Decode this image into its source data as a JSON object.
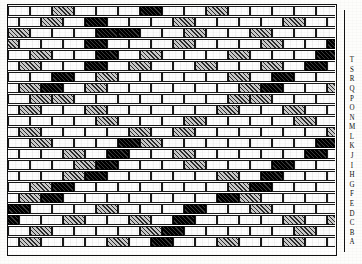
{
  "plate": {
    "title": "Decorative diaper brickwork elevation",
    "description": "Measured elevation of a brick wall laid in stretcher bond with grey and dark vitrified headers forming repeating lozenge (diamond) diaper patterns.",
    "drawing_type": "brick-bond-elevation"
  },
  "legend": {
    "brick_kinds": [
      {
        "key": "plain",
        "label": "plain red brick",
        "color": "#fdfdfd"
      },
      {
        "key": "grey",
        "label": "grey diapered brick",
        "color": "#9a9a9a"
      },
      {
        "key": "mid",
        "label": "mid-tone brick",
        "color": "#8d8d8d"
      },
      {
        "key": "dark",
        "label": "dark vitrified header",
        "color": "#121212"
      }
    ]
  },
  "course_labels": {
    "orientation": "vertical",
    "reading": "bottom-to-top",
    "items": [
      "A",
      "B",
      "C",
      "D",
      "E",
      "F",
      "G",
      "H",
      "I",
      "J",
      "K",
      "L",
      "M",
      "N",
      "O",
      "P",
      "Q",
      "R",
      "S",
      "T"
    ]
  },
  "geometry": {
    "rows": 22,
    "row_height": 11,
    "brick_width": 22,
    "offset": 11,
    "wall_width": 327,
    "wall_height": 248
  },
  "bond": {
    "name": "stretcher bond",
    "rows": [
      {
        "offset": 0,
        "pattern": "p p p g p p p d p p g p p p p p g p p p d p p p g p"
      },
      {
        "offset": 11,
        "pattern": "p p g p d p p p g p p p p g p p p d p p g p p p p"
      },
      {
        "offset": 0,
        "pattern": "p g p p p d d p p g p p g p p p p d p p p g p p g p"
      },
      {
        "offset": 11,
        "pattern": "g p p p d p p p g p p p g p p d p p p g p p p g p"
      },
      {
        "offset": 0,
        "pattern": "p p g p p d p g p p p g p p p d p p g p p p g p p p"
      },
      {
        "offset": 11,
        "pattern": "p g p p d p g p p g p p g p d p p g p p g p p g p"
      },
      {
        "offset": 0,
        "pattern": "g p p d p g p p p p p g p d p p g p p p p g p p d p"
      },
      {
        "offset": 11,
        "pattern": "p g d p g p p p p p p g d p p g p p p p g p d p p"
      },
      {
        "offset": 0,
        "pattern": "p p g g p p p p p p p g g p p p g p p p g g p p p p"
      },
      {
        "offset": 11,
        "pattern": "p g p p g p p p p p g p p g p p p g p g p p g p p"
      },
      {
        "offset": 0,
        "pattern": "g p p p p g p p p g p p p p g p p p g p p p p g p p"
      },
      {
        "offset": 11,
        "pattern": "p g p p p p g p g p p p p p p g p g p p p p g p p"
      },
      {
        "offset": 0,
        "pattern": "p p g p p p d g p p p p p p p d g p p p p g p p p p"
      },
      {
        "offset": 11,
        "pattern": "p p p g p d p p g p p p p p d p p g p p p g p p p"
      },
      {
        "offset": 0,
        "pattern": "p p p p g d p p p g p p p d p p p p g p g p p p p p"
      },
      {
        "offset": 11,
        "pattern": "p p p g d p p p p p g p d p p p p p g d p p p p p"
      },
      {
        "offset": 0,
        "pattern": "p p g d p p p p p p p g d p p p p g p d p p p p p p"
      },
      {
        "offset": 11,
        "pattern": "p g d p p p p p p p d g p p p p g p p p d p p p p"
      },
      {
        "offset": 0,
        "pattern": "g d p p p g p p p d p p g p p p g p p p p d p p g p"
      },
      {
        "offset": 11,
        "pattern": "d p p g p p g p d p p p p g p g p p p g p p d p g"
      },
      {
        "offset": 0,
        "pattern": "p p g p p p p g d p p p p p g p p p d p p g p p p p"
      },
      {
        "offset": 11,
        "pattern": "p g p p p g p d p p g p p g p p d p p p g p p g p"
      }
    ]
  }
}
